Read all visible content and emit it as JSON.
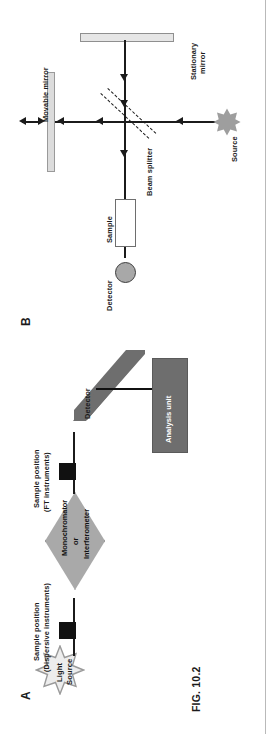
{
  "figure": {
    "caption": "FIG. 10.2",
    "orientation": "rotated-90-ccw",
    "page_background": "#ffffff"
  },
  "panels": [
    {
      "id": "B",
      "letter": "B",
      "title": "Michelson interferometer schematic",
      "labels": {
        "movable_mirror": "Movable mirror",
        "stationary_mirror_line1": "Stationary",
        "stationary_mirror_line2": "mirror",
        "beam_splitter": "Beam splitter",
        "source": "Source",
        "sample": "Sample",
        "detector": "Detector"
      },
      "colors": {
        "beam": "#1b1b1b",
        "movable_mirror_fill": "#dcdcdc",
        "stationary_mirror_fill": "#e6e6e6",
        "source_star_fill": "#9e9e9e",
        "detector_fill": "#a8a8a8",
        "sample_fill": "#ffffff"
      }
    },
    {
      "id": "A",
      "letter": "A",
      "title": "Dispersive / FT spectrometer block diagram",
      "labels": {
        "light_source_line1": "Light",
        "light_source_line2": "Source",
        "sample_pos_dispersive_line1": "Sample position",
        "sample_pos_dispersive_line2": "(Dispersive instruments)",
        "sample_pos_ft_line1": "Sample position",
        "sample_pos_ft_line2": "(FT instruments)",
        "monochromator_line1": "Monochromator",
        "monochromator_line2": "or",
        "monochromator_line3": "Interferometer",
        "detector": "Detector",
        "analysis_unit": "Analysis unit"
      },
      "colors": {
        "light_source_fill": "#ededed",
        "monochromator_fill": "#a9a9a9",
        "sample_square_fill": "#111111",
        "detector_fill": "#6e6e6e",
        "analysis_unit_fill": "#6e6e6e",
        "analysis_unit_text": "#ffffff"
      }
    }
  ]
}
